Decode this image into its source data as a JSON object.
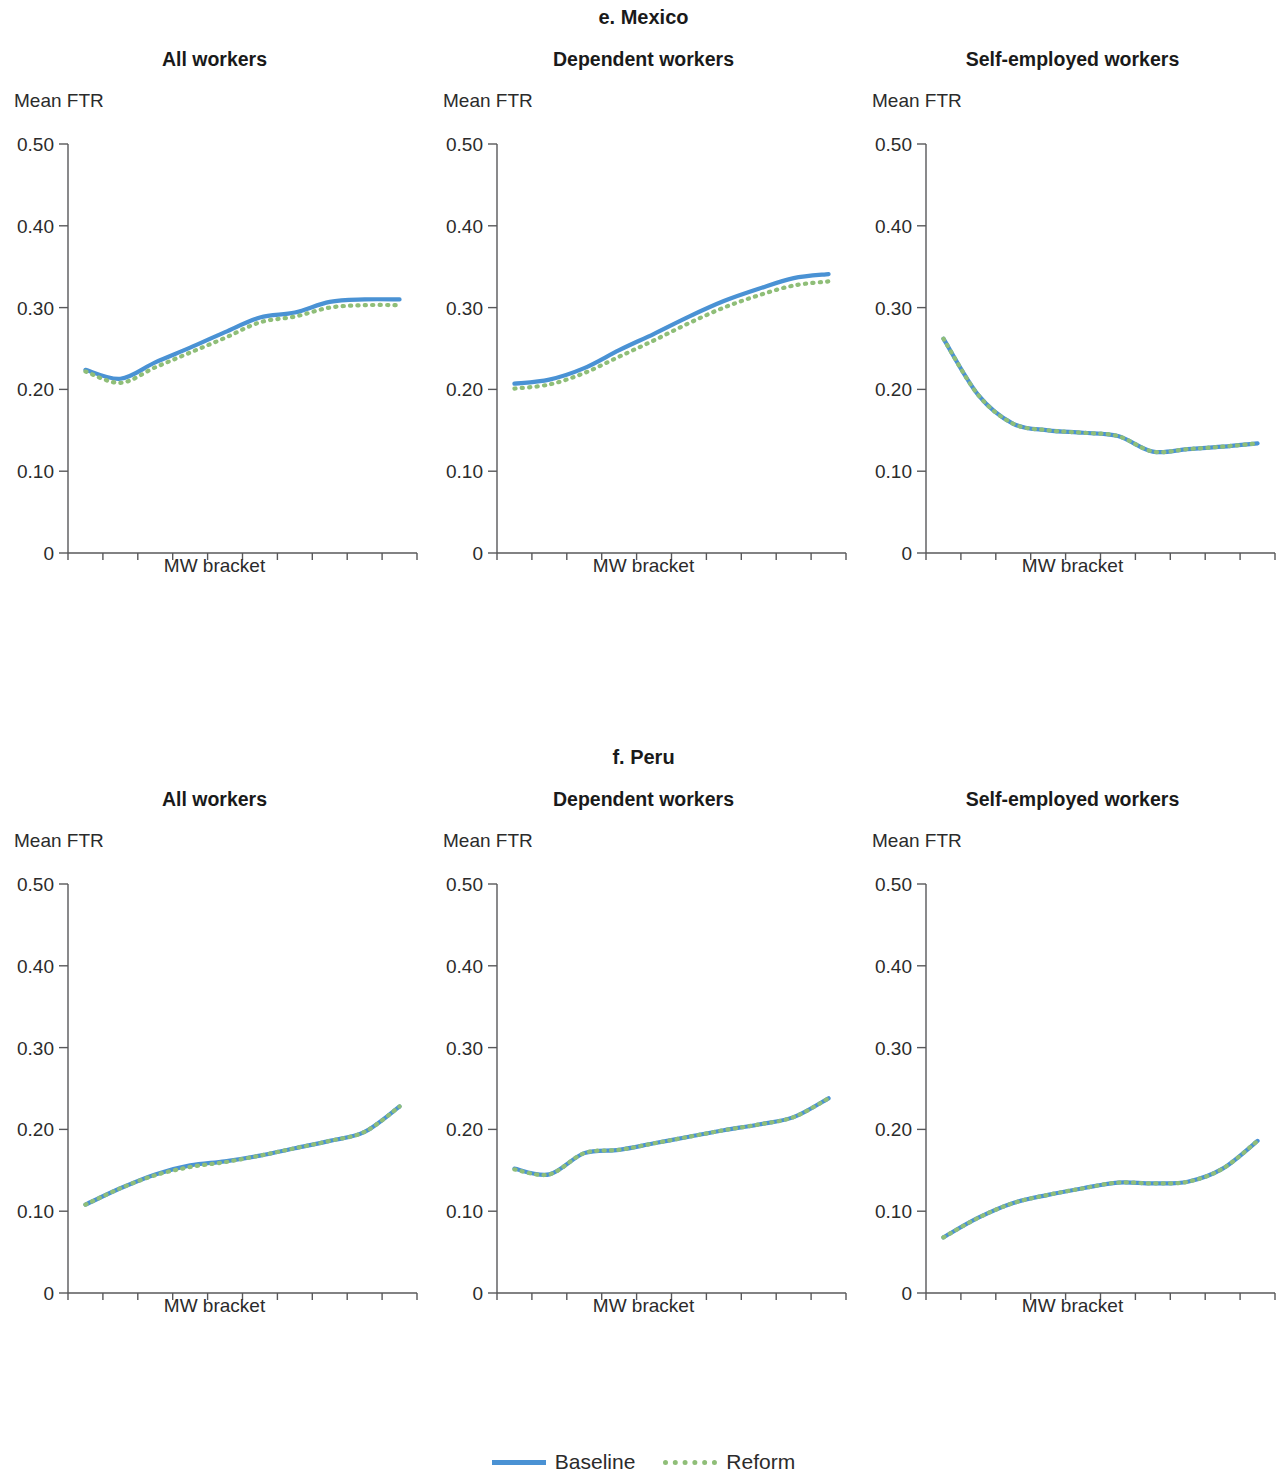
{
  "figure": {
    "legend": [
      {
        "label": "Baseline",
        "style": "solid",
        "color": "#4a92d4"
      },
      {
        "label": "Reform",
        "style": "dotted",
        "color": "#8fbe78"
      }
    ],
    "axis_color": "#58585a"
  },
  "sections": [
    {
      "title": "e. Mexico",
      "panels": [
        {
          "title": "All workers",
          "ylabel": "Mean FTR",
          "xlabel": "MW bracket"
        },
        {
          "title": "Dependent workers",
          "ylabel": "Mean FTR",
          "xlabel": "MW bracket"
        },
        {
          "title": "Self-employed workers",
          "ylabel": "Mean FTR",
          "xlabel": "MW bracket"
        }
      ]
    },
    {
      "title": "f. Peru",
      "panels": [
        {
          "title": "All workers",
          "ylabel": "Mean FTR",
          "xlabel": "MW bracket"
        },
        {
          "title": "Dependent workers",
          "ylabel": "Mean FTR",
          "xlabel": "MW bracket"
        },
        {
          "title": "Self-employed workers",
          "ylabel": "Mean FTR",
          "xlabel": "MW bracket"
        }
      ]
    }
  ],
  "chart_data": [
    {
      "type": "line",
      "title": "e. Mexico — All workers",
      "panel": "All workers",
      "group": "e. Mexico",
      "xlabel": "MW bracket",
      "ylabel": "Mean FTR",
      "ylim": [
        0,
        0.5
      ],
      "yticks": [
        0,
        0.1,
        0.2,
        0.3,
        0.4,
        0.5
      ],
      "ytick_labels": [
        "0",
        "0.10",
        "0.20",
        "0.30",
        "0.40",
        "0.50"
      ],
      "grid": false,
      "legend_position": "bottom",
      "categories": [
        "[0, 0.5]",
        "[0.5, 1.0]",
        "[1.0, 1.5]",
        "[1.5, 2.0]",
        "[2.0, 2.5]",
        "[2.5, 3.0]",
        "[3.0, 3.5]",
        "[3.5, 4.0]",
        "[4.0, 4.5]",
        "[4.5, 5.0]"
      ],
      "series": [
        {
          "name": "Baseline",
          "color": "#4a92d4",
          "style": "solid",
          "values": [
            0.224,
            0.213,
            0.233,
            0.251,
            0.27,
            0.288,
            0.294,
            0.307,
            0.31,
            0.31
          ]
        },
        {
          "name": "Reform",
          "color": "#8fbe78",
          "style": "dotted",
          "values": [
            0.222,
            0.208,
            0.227,
            0.245,
            0.263,
            0.282,
            0.289,
            0.3,
            0.303,
            0.303
          ]
        }
      ]
    },
    {
      "type": "line",
      "title": "e. Mexico — Dependent workers",
      "panel": "Dependent workers",
      "group": "e. Mexico",
      "xlabel": "MW bracket",
      "ylabel": "Mean FTR",
      "ylim": [
        0,
        0.5
      ],
      "yticks": [
        0,
        0.1,
        0.2,
        0.3,
        0.4,
        0.5
      ],
      "ytick_labels": [
        "0",
        "0.10",
        "0.20",
        "0.30",
        "0.40",
        "0.50"
      ],
      "grid": false,
      "legend_position": "bottom",
      "categories": [
        "[0, 0.5]",
        "[0.5, 1.0]",
        "[1.0, 1.5]",
        "[1.5, 2.0]",
        "[2.0, 2.5]",
        "[2.5, 3.0]",
        "[3.0, 3.5]",
        "[3.5, 4.0]",
        "[4.0, 4.5]",
        "[4.5, 5.0]"
      ],
      "series": [
        {
          "name": "Baseline",
          "color": "#4a92d4",
          "style": "solid",
          "values": [
            0.207,
            0.212,
            0.226,
            0.248,
            0.268,
            0.289,
            0.308,
            0.323,
            0.336,
            0.341
          ]
        },
        {
          "name": "Reform",
          "color": "#8fbe78",
          "style": "dotted",
          "values": [
            0.201,
            0.206,
            0.22,
            0.24,
            0.26,
            0.281,
            0.3,
            0.315,
            0.327,
            0.332
          ]
        }
      ]
    },
    {
      "type": "line",
      "title": "e. Mexico — Self-employed workers",
      "panel": "Self-employed workers",
      "group": "e. Mexico",
      "xlabel": "MW bracket",
      "ylabel": "Mean FTR",
      "ylim": [
        0,
        0.5
      ],
      "yticks": [
        0,
        0.1,
        0.2,
        0.3,
        0.4,
        0.5
      ],
      "ytick_labels": [
        "0",
        "0.10",
        "0.20",
        "0.30",
        "0.40",
        "0.50"
      ],
      "grid": false,
      "legend_position": "bottom",
      "categories": [
        "[0, 0.5]",
        "[0.5, 1.0]",
        "[1.0, 1.5]",
        "[1.5, 2.0]",
        "[2.0, 2.5]",
        "[2.5, 3.0]",
        "[3.0, 3.5]",
        "[3.5, 4.0]",
        "[4.0, 4.5]",
        "[4.5, 5.0]"
      ],
      "series": [
        {
          "name": "Baseline",
          "color": "#4a92d4",
          "style": "solid",
          "values": [
            0.262,
            0.193,
            0.158,
            0.15,
            0.147,
            0.143,
            0.124,
            0.127,
            0.13,
            0.134
          ]
        },
        {
          "name": "Reform",
          "color": "#8fbe78",
          "style": "dotted",
          "values": [
            0.262,
            0.193,
            0.158,
            0.15,
            0.147,
            0.143,
            0.124,
            0.127,
            0.13,
            0.134
          ]
        }
      ]
    },
    {
      "type": "line",
      "title": "f. Peru — All workers",
      "panel": "All workers",
      "group": "f. Peru",
      "xlabel": "MW bracket",
      "ylabel": "Mean FTR",
      "ylim": [
        0,
        0.5
      ],
      "yticks": [
        0,
        0.1,
        0.2,
        0.3,
        0.4,
        0.5
      ],
      "ytick_labels": [
        "0",
        "0.10",
        "0.20",
        "0.30",
        "0.40",
        "0.50"
      ],
      "grid": false,
      "legend_position": "bottom",
      "categories": [
        "[0, 0.5]",
        "[0.5, 1.0]",
        "[1.0, 1.5]",
        "[1.5, 2.0]",
        "[2.0, 2.5]",
        "[2.5, 3.0]",
        "[3.0, 3.5]",
        "[3.5, 4.0]",
        "[4.0, 4.5]",
        "[4.5, 5.0]"
      ],
      "series": [
        {
          "name": "Baseline",
          "color": "#4a92d4",
          "style": "solid",
          "values": [
            0.108,
            0.128,
            0.145,
            0.156,
            0.161,
            0.168,
            0.177,
            0.186,
            0.197,
            0.228
          ]
        },
        {
          "name": "Reform",
          "color": "#8fbe78",
          "style": "dotted",
          "values": [
            0.108,
            0.128,
            0.144,
            0.154,
            0.16,
            0.168,
            0.177,
            0.186,
            0.197,
            0.228
          ]
        }
      ]
    },
    {
      "type": "line",
      "title": "f. Peru — Dependent workers",
      "panel": "Dependent workers",
      "group": "f. Peru",
      "xlabel": "MW bracket",
      "ylabel": "Mean FTR",
      "ylim": [
        0,
        0.5
      ],
      "yticks": [
        0,
        0.1,
        0.2,
        0.3,
        0.4,
        0.5
      ],
      "ytick_labels": [
        "0",
        "0.10",
        "0.20",
        "0.30",
        "0.40",
        "0.50"
      ],
      "grid": false,
      "legend_position": "bottom",
      "categories": [
        "[0, 0.5]",
        "[0.5, 1.0]",
        "[1.0, 1.5]",
        "[1.5, 2.0]",
        "[2.0, 2.5]",
        "[2.5, 3.0]",
        "[3.0, 3.5]",
        "[3.5, 4.0]",
        "[4.0, 4.5]",
        "[4.5, 5.0]"
      ],
      "series": [
        {
          "name": "Baseline",
          "color": "#4a92d4",
          "style": "solid",
          "values": [
            0.152,
            0.145,
            0.171,
            0.175,
            0.183,
            0.191,
            0.199,
            0.206,
            0.215,
            0.238
          ]
        },
        {
          "name": "Reform",
          "color": "#8fbe78",
          "style": "dotted",
          "values": [
            0.151,
            0.145,
            0.171,
            0.175,
            0.183,
            0.191,
            0.199,
            0.206,
            0.215,
            0.238
          ]
        }
      ]
    },
    {
      "type": "line",
      "title": "f. Peru — Self-employed workers",
      "panel": "Self-employed workers",
      "group": "f. Peru",
      "xlabel": "MW bracket",
      "ylabel": "Mean FTR",
      "ylim": [
        0,
        0.5
      ],
      "yticks": [
        0,
        0.1,
        0.2,
        0.3,
        0.4,
        0.5
      ],
      "ytick_labels": [
        "0",
        "0.10",
        "0.20",
        "0.30",
        "0.40",
        "0.50"
      ],
      "grid": false,
      "legend_position": "bottom",
      "categories": [
        "[0, 0.5]",
        "[0.5, 1.0]",
        "[1.0, 1.5]",
        "[1.5, 2.0]",
        "[2.0, 2.5]",
        "[2.5, 3.0]",
        "[3.0, 3.5]",
        "[3.5, 4.0]",
        "[4.0, 4.5]",
        "[4.5, 5.0]"
      ],
      "series": [
        {
          "name": "Baseline",
          "color": "#4a92d4",
          "style": "solid",
          "values": [
            0.068,
            0.092,
            0.11,
            0.12,
            0.128,
            0.135,
            0.134,
            0.136,
            0.152,
            0.186
          ]
        },
        {
          "name": "Reform",
          "color": "#8fbe78",
          "style": "dotted",
          "values": [
            0.068,
            0.092,
            0.11,
            0.12,
            0.128,
            0.135,
            0.134,
            0.136,
            0.152,
            0.186
          ]
        }
      ]
    }
  ]
}
